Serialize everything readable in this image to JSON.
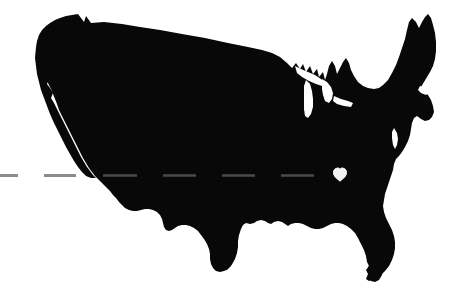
{
  "image": {
    "title": "United States silhouette map with heart marker",
    "width": 471,
    "height": 298,
    "background_color": "#ffffff"
  },
  "map": {
    "name": "contiguous-united-states",
    "fill_color": "#080808",
    "description": "Solid black silhouette of the contiguous United States",
    "bounds": {
      "x": 36,
      "y": 14,
      "width": 404,
      "height": 268
    }
  },
  "heart_marker": {
    "name": "heart",
    "fill_color": "#f2f2f2",
    "label": "",
    "center_x": 340,
    "center_y": 175,
    "width": 15,
    "height": 14,
    "region": "southeastern united states"
  },
  "dashed_line": {
    "name": "horizontal-dashed-line",
    "color_over_background": "#8c8c8c",
    "color_over_map": "#4a4a4a",
    "y": 175,
    "thickness": 3,
    "dash_length": 30,
    "gap_length": 26,
    "x_start": 0,
    "x_end": 471,
    "segments_outside_map": [
      {
        "x": 0,
        "width": 18
      },
      {
        "x": 44,
        "width": 32
      }
    ],
    "segments_over_map": [
      {
        "x": 103,
        "width": 34
      },
      {
        "x": 163,
        "width": 33
      },
      {
        "x": 222,
        "width": 33
      },
      {
        "x": 281,
        "width": 33
      }
    ]
  }
}
